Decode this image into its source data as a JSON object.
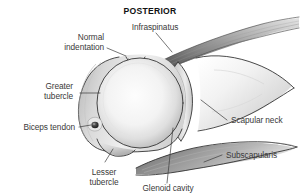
{
  "figure": {
    "title": "POSTERIOR",
    "view": "posterior-shoulder-joint",
    "background_color": "#ffffff",
    "line_color": "#2b2b2b",
    "label_color": "#3a3a3a",
    "labels": [
      {
        "id": "infraspinatus",
        "text": "Infraspinatus",
        "lines": [
          "Infraspinatus"
        ],
        "anchor": "middle"
      },
      {
        "id": "normal-indentation",
        "text": "Normal indentation",
        "lines": [
          "Normal",
          "indentation"
        ],
        "anchor": "end"
      },
      {
        "id": "greater-tubercle",
        "text": "Greater tubercle",
        "lines": [
          "Greater",
          "tubercle"
        ],
        "anchor": "end"
      },
      {
        "id": "biceps-tendon",
        "text": "Biceps tendon",
        "lines": [
          "Biceps tendon"
        ],
        "anchor": "end"
      },
      {
        "id": "lesser-tubercle",
        "text": "Lesser tubercle",
        "lines": [
          "Lesser",
          "tubercle"
        ],
        "anchor": "middle"
      },
      {
        "id": "glenoid-cavity",
        "text": "Glenoid cavity",
        "lines": [
          "Glenoid cavity"
        ],
        "anchor": "middle"
      },
      {
        "id": "subscapularis",
        "text": "Subscapularis",
        "lines": [
          "Subscapularis"
        ],
        "anchor": "start"
      },
      {
        "id": "scapular-neck",
        "text": "Scapular neck",
        "lines": [
          "Scapular neck"
        ],
        "anchor": "start"
      }
    ],
    "structures": [
      {
        "id": "humeral-head",
        "name": "Humeral head"
      },
      {
        "id": "greater-tubercle-mass",
        "name": "Greater tubercle"
      },
      {
        "id": "lesser-tubercle-mass",
        "name": "Lesser tubercle"
      },
      {
        "id": "biceps-tendon-dot",
        "name": "Biceps tendon in groove"
      },
      {
        "id": "glenoid-cavity-strip",
        "name": "Glenoid cavity"
      },
      {
        "id": "scapular-neck-body",
        "name": "Scapular neck"
      },
      {
        "id": "infraspinatus-muscle",
        "name": "Infraspinatus muscle"
      },
      {
        "id": "subscapularis-muscle",
        "name": "Subscapularis muscle"
      }
    ]
  }
}
